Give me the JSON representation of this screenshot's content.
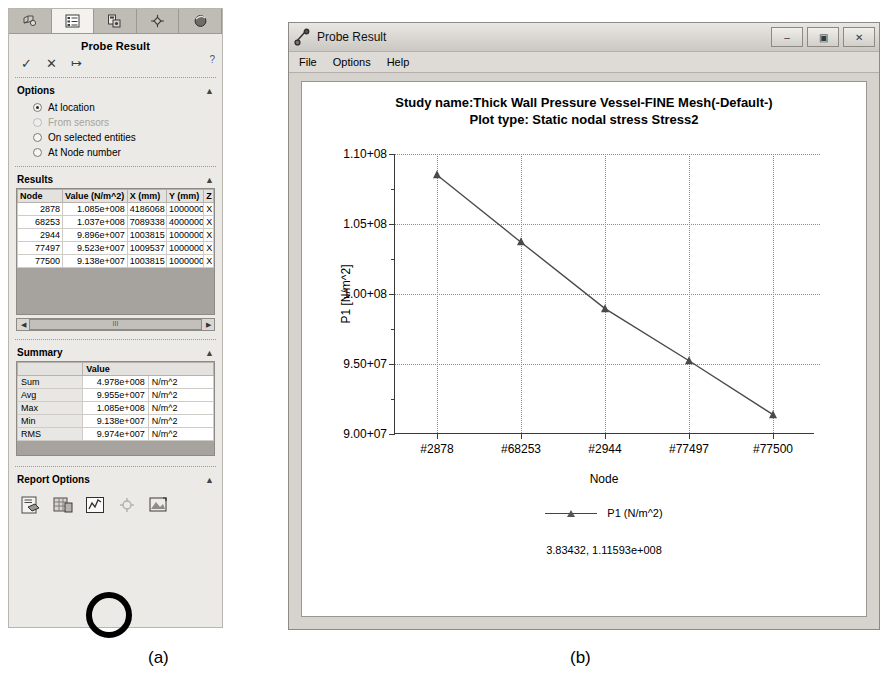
{
  "panel_a": {
    "tabs": [
      {
        "name": "tab-model",
        "icon": "model-icon",
        "active": false
      },
      {
        "name": "tab-property-manager",
        "icon": "list-icon",
        "active": true
      },
      {
        "name": "tab-configuration",
        "icon": "config-icon",
        "active": false
      },
      {
        "name": "tab-display",
        "icon": "crosshair-icon",
        "active": false
      },
      {
        "name": "tab-appearance",
        "icon": "sphere-icon",
        "active": false
      }
    ],
    "title": "Probe Result",
    "help_label": "?",
    "actions": [
      {
        "name": "accept-button",
        "glyph": "✓"
      },
      {
        "name": "cancel-button",
        "glyph": "✕"
      },
      {
        "name": "pin-button",
        "glyph": "↦"
      }
    ],
    "options": {
      "header": "Options",
      "items": [
        {
          "label": "At location",
          "selected": true,
          "disabled": false
        },
        {
          "label": "From sensors",
          "selected": false,
          "disabled": true
        },
        {
          "label": "On selected entities",
          "selected": false,
          "disabled": false
        },
        {
          "label": "At Node number",
          "selected": false,
          "disabled": false
        }
      ]
    },
    "results": {
      "header": "Results",
      "columns": [
        "Node",
        "Value (N/m^2)",
        "X (mm)",
        "Y (mm)",
        "Z"
      ],
      "rows": [
        [
          "2878",
          "1.085e+008",
          "4186068",
          "1000000",
          "X"
        ],
        [
          "68253",
          "1.037e+008",
          "7089338",
          "4000000",
          "X"
        ],
        [
          "2944",
          "9.896e+007",
          "1003815",
          "1000000",
          "X"
        ],
        [
          "77497",
          "9.523e+007",
          "1009537",
          "1000000",
          "X"
        ],
        [
          "77500",
          "9.138e+007",
          "1003815",
          "1000000",
          "X"
        ]
      ],
      "scroll_thumb": "III"
    },
    "summary": {
      "header": "Summary",
      "col_blank": "",
      "col_value": "Value",
      "rows": [
        {
          "label": "Sum",
          "value": "4.978e+008",
          "unit": "N/m^2"
        },
        {
          "label": "Avg",
          "value": "9.955e+007",
          "unit": "N/m^2"
        },
        {
          "label": "Max",
          "value": "1.085e+008",
          "unit": "N/m^2"
        },
        {
          "label": "Min",
          "value": "9.138e+007",
          "unit": "N/m^2"
        },
        {
          "label": "RMS",
          "value": "9.974e+007",
          "unit": "N/m^2"
        }
      ]
    },
    "report_options": {
      "header": "Report Options",
      "buttons": [
        {
          "name": "report-save-as-button",
          "icon": "report-icon"
        },
        {
          "name": "save-as-csv-button",
          "icon": "spreadsheet-icon"
        },
        {
          "name": "plot-graph-button",
          "icon": "line-chart-icon",
          "highlighted": true
        },
        {
          "name": "animate-button",
          "icon": "gear-icon",
          "disabled": true
        },
        {
          "name": "save-image-button",
          "icon": "image-icon"
        }
      ]
    }
  },
  "panel_b": {
    "window_title": "Probe Result",
    "window_icon": "probe-icon",
    "window_buttons": [
      {
        "name": "minimize-button",
        "glyph": "–"
      },
      {
        "name": "maximize-button",
        "glyph": "▣"
      },
      {
        "name": "close-button",
        "glyph": "✕"
      }
    ],
    "menu": [
      "File",
      "Options",
      "Help"
    ],
    "status_text": "3.83432, 1.11593e+008"
  },
  "chart_data": {
    "type": "line",
    "title": "Study name:Thick Wall Pressure Vessel-FINE Mesh(-Default-)",
    "subtitle": "Plot type: Static nodal stress Stress2",
    "xlabel": "Node",
    "ylabel": "P1 [N/m^2]",
    "categories": [
      "#2878",
      "#68253",
      "#2944",
      "#77497",
      "#77500"
    ],
    "values": [
      108500000,
      103700000,
      98960000,
      95230000,
      91380000
    ],
    "ylim": [
      90000000,
      110000000
    ],
    "ytick_labels": [
      "1.10+08",
      "1.05+08",
      "1.00+08",
      "9.50+07",
      "9.00+07"
    ],
    "ytick_values": [
      110000000,
      105000000,
      100000000,
      95000000,
      90000000
    ],
    "grid": true,
    "legend": [
      {
        "name": "P1 (N/m^2)",
        "marker": "triangle"
      }
    ],
    "legend_position": "below"
  },
  "figure_labels": {
    "a": "(a)",
    "b": "(b)"
  }
}
